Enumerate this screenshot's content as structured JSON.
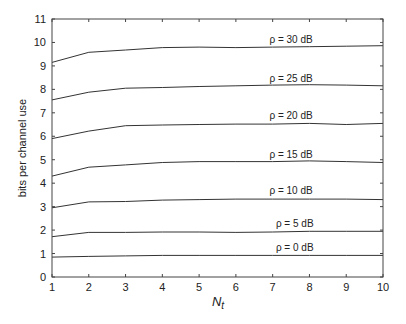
{
  "chart_data": {
    "type": "line",
    "title": "",
    "xlabel": "N_t",
    "xlabel_main": "N",
    "xlabel_sub": "t",
    "ylabel": "bits per channel use",
    "x": [
      1,
      2,
      3,
      4,
      5,
      6,
      7,
      8,
      9,
      10
    ],
    "xlim": [
      1,
      10
    ],
    "ylim": [
      0,
      11
    ],
    "xticks": [
      1,
      2,
      3,
      4,
      5,
      6,
      7,
      8,
      9,
      10
    ],
    "yticks": [
      0,
      1,
      2,
      3,
      4,
      5,
      6,
      7,
      8,
      9,
      10,
      11
    ],
    "grid": false,
    "legend": "inline labels",
    "line_color": "#333333",
    "series": [
      {
        "name": "ρ = 30 dB",
        "label_x": 7.5,
        "label_y": 10.15,
        "values": [
          9.15,
          9.58,
          9.68,
          9.78,
          9.8,
          9.78,
          9.8,
          9.82,
          9.84,
          9.86
        ]
      },
      {
        "name": "ρ = 25 dB",
        "label_x": 7.5,
        "label_y": 8.5,
        "values": [
          7.55,
          7.88,
          8.05,
          8.08,
          8.12,
          8.15,
          8.18,
          8.2,
          8.18,
          8.15
        ]
      },
      {
        "name": "ρ = 20 dB",
        "label_x": 7.5,
        "label_y": 6.9,
        "values": [
          5.9,
          6.22,
          6.45,
          6.48,
          6.5,
          6.52,
          6.52,
          6.55,
          6.5,
          6.55
        ]
      },
      {
        "name": "ρ = 15 dB",
        "label_x": 7.5,
        "label_y": 5.25,
        "values": [
          4.3,
          4.68,
          4.78,
          4.88,
          4.92,
          4.92,
          4.92,
          4.95,
          4.92,
          4.88
        ]
      },
      {
        "name": "ρ = 10 dB",
        "label_x": 7.5,
        "label_y": 3.7,
        "values": [
          2.95,
          3.2,
          3.22,
          3.28,
          3.3,
          3.32,
          3.32,
          3.32,
          3.32,
          3.3
        ]
      },
      {
        "name": "ρ = 5 dB",
        "label_x": 7.6,
        "label_y": 2.3,
        "values": [
          1.72,
          1.9,
          1.9,
          1.92,
          1.92,
          1.9,
          1.92,
          1.95,
          1.95,
          1.95
        ]
      },
      {
        "name": "ρ = 0 dB",
        "label_x": 7.6,
        "label_y": 1.28,
        "values": [
          0.85,
          0.88,
          0.9,
          0.92,
          0.92,
          0.92,
          0.92,
          0.92,
          0.92,
          0.92
        ]
      }
    ]
  }
}
